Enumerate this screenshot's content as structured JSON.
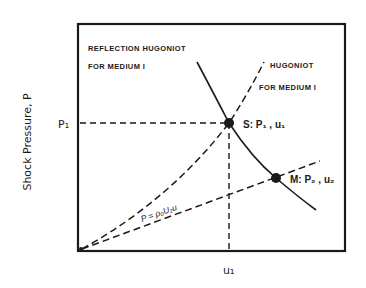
{
  "figure": {
    "y_axis_label": "Shock Pressure, P",
    "y_tick_label": "P₁",
    "x_tick_label": "u₁",
    "curves": {
      "reflection_hugoniot": {
        "label_line1": "REFLECTION HUGONIOT",
        "label_line2": "FOR MEDIUM I",
        "style": "solid"
      },
      "hugoniot": {
        "label_line1": "HUGONIOT",
        "label_line2": "FOR MEDIUM I",
        "style": "dashed"
      },
      "rayleigh_line": {
        "label": "P = ρ₀U₂u",
        "style": "dashed"
      }
    },
    "points": {
      "S": {
        "label": "S: P₁ , u₁"
      },
      "M": {
        "label": "M: P₂ , u₂"
      }
    },
    "colors": {
      "ink": "#1a1a1a",
      "background": "#ffffff"
    }
  }
}
